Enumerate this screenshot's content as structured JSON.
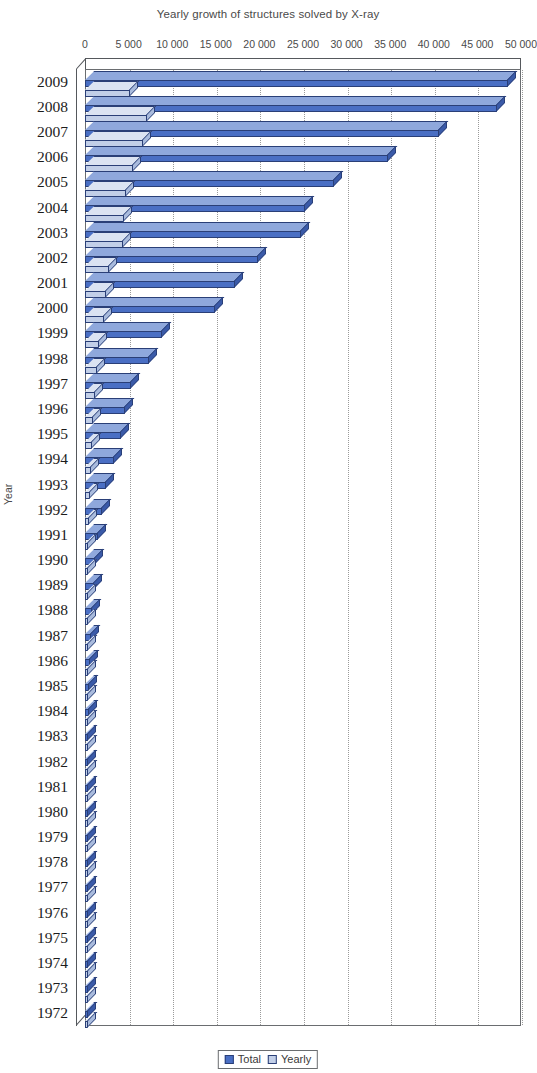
{
  "chart_data": {
    "type": "bar",
    "orientation": "horizontal",
    "title": "Yearly growth of structures solved by X-ray",
    "xlabel": "",
    "ylabel": "Year",
    "xlim": [
      0,
      50000
    ],
    "xticks": [
      0,
      5000,
      10000,
      15000,
      20000,
      25000,
      30000,
      35000,
      40000,
      45000,
      50000
    ],
    "xtick_labels": [
      "0",
      "5 000",
      "10 000",
      "15 000",
      "20 000",
      "25 000",
      "30 000",
      "35 000",
      "40 000",
      "45 000",
      "50 000"
    ],
    "grid": true,
    "legend_position": "bottom",
    "categories": [
      "2009",
      "2008",
      "2007",
      "2006",
      "2005",
      "2004",
      "2003",
      "2002",
      "2001",
      "2000",
      "1999",
      "1998",
      "1997",
      "1996",
      "1995",
      "1994",
      "1993",
      "1992",
      "1991",
      "1990",
      "1989",
      "1988",
      "1987",
      "1986",
      "1985",
      "1984",
      "1983",
      "1982",
      "1981",
      "1980",
      "1979",
      "1978",
      "1977",
      "1976",
      "1975",
      "1974",
      "1973",
      "1972"
    ],
    "series": [
      {
        "name": "Total",
        "color": "#4a6fc4",
        "values": [
          48500,
          47200,
          40600,
          34800,
          28600,
          25200,
          24800,
          19800,
          17200,
          14900,
          8800,
          7300,
          5300,
          4600,
          4100,
          3300,
          2400,
          1900,
          1500,
          1200,
          1000,
          850,
          700,
          600,
          500,
          430,
          370,
          320,
          270,
          230,
          200,
          180,
          160,
          140,
          120,
          100,
          80,
          60
        ]
      },
      {
        "name": "Yearly",
        "color": "#c2cfe8",
        "values": [
          5200,
          7100,
          6600,
          5500,
          4700,
          4500,
          4400,
          2700,
          2400,
          2200,
          1600,
          1400,
          1100,
          900,
          800,
          700,
          550,
          450,
          380,
          330,
          280,
          240,
          210,
          180,
          160,
          140,
          120,
          100,
          90,
          80,
          70,
          60,
          55,
          50,
          45,
          40,
          35,
          30
        ]
      }
    ]
  },
  "legend": {
    "total_label": "Total",
    "yearly_label": "Yearly"
  }
}
